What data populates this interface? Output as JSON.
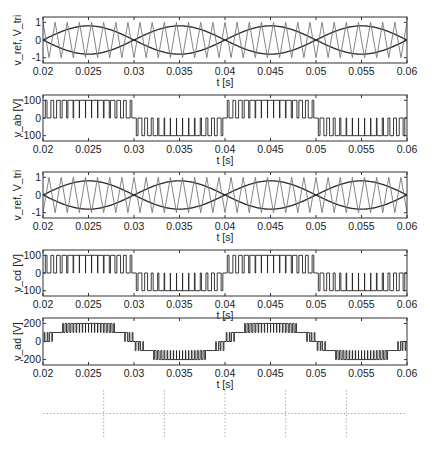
{
  "colors": {
    "axis": "#333333",
    "ref": "#2a2a2a",
    "tri": "#777777",
    "signal": "#222222",
    "grid": "#888888",
    "bar": "#111111"
  },
  "chart_data": [
    {
      "id": "p1",
      "type": "line",
      "ylabel": "v_ref, V_tri",
      "xlabel": "t [s]",
      "box": [
        43,
        17,
        364,
        46
      ],
      "xlim": [
        0.02,
        0.06
      ],
      "ylim": [
        -1.3,
        1.3
      ],
      "xticks": [
        0.02,
        0.025,
        0.03,
        0.035,
        0.04,
        0.045,
        0.05,
        0.055,
        0.06
      ],
      "xticklabels": [
        "0.02",
        "0.025",
        "0.03",
        "0.035",
        "0.04",
        "0.045",
        "0.05",
        "0.055",
        "0.06"
      ],
      "yticks": [
        -1,
        0,
        1
      ],
      "yticklabels": [
        "-1",
        "0",
        "1"
      ],
      "series": [
        {
          "name": "v_ref (+)",
          "kind": "sine",
          "amp": 0.8,
          "freq": 50,
          "phase": 0
        },
        {
          "name": "v_ref (-)",
          "kind": "sine",
          "amp": -0.8,
          "freq": 50,
          "phase": 0
        },
        {
          "name": "V_tri",
          "kind": "triangle",
          "amp": 1.0,
          "freq": 750
        }
      ]
    },
    {
      "id": "p2",
      "type": "line",
      "ylabel": "v_ab [V]",
      "xlabel": "t [s]",
      "box": [
        43,
        95,
        364,
        46
      ],
      "xlim": [
        0.02,
        0.06
      ],
      "ylim": [
        -130,
        130
      ],
      "xticks": [
        0.02,
        0.025,
        0.03,
        0.035,
        0.04,
        0.045,
        0.05,
        0.055,
        0.06
      ],
      "xticklabels": [
        "0.02",
        "0.025",
        "0.03",
        "0.035",
        "0.04",
        "0.045",
        "0.05",
        "0.055",
        "0.06"
      ],
      "yticks": [
        -100,
        0,
        100
      ],
      "yticklabels": [
        "-100",
        "0",
        "100"
      ],
      "series": [
        {
          "name": "v_ab",
          "kind": "unipolar_pwm",
          "vdc": 100,
          "amp": 0.8,
          "freq": 50,
          "carrier": 750,
          "phase": 0
        }
      ]
    },
    {
      "id": "p3",
      "type": "line",
      "ylabel": "v_ref, V_tri",
      "xlabel": "t [s]",
      "box": [
        43,
        172,
        364,
        46
      ],
      "xlim": [
        0.02,
        0.06
      ],
      "ylim": [
        -1.3,
        1.3
      ],
      "xticks": [
        0.02,
        0.025,
        0.03,
        0.035,
        0.04,
        0.045,
        0.05,
        0.055,
        0.06
      ],
      "xticklabels": [
        "0.02",
        "0.025",
        "0.03",
        "0.035",
        "0.04",
        "0.045",
        "0.05",
        "0.055",
        "0.06"
      ],
      "yticks": [
        -1,
        0,
        1
      ],
      "yticklabels": [
        "-1",
        "0",
        "1"
      ],
      "series": [
        {
          "name": "v_ref (+)",
          "kind": "sine",
          "amp": 0.8,
          "freq": 50,
          "phase": 0
        },
        {
          "name": "v_ref (-)",
          "kind": "sine",
          "amp": -0.8,
          "freq": 50,
          "phase": 0
        },
        {
          "name": "V_tri",
          "kind": "triangle",
          "amp": 1.0,
          "freq": 750,
          "shift": 0.5
        }
      ]
    },
    {
      "id": "p4",
      "type": "line",
      "ylabel": "v_cd [V]",
      "xlabel": "t [s]",
      "box": [
        43,
        250,
        364,
        46
      ],
      "xlim": [
        0.02,
        0.06
      ],
      "ylim": [
        -130,
        130
      ],
      "xticks": [
        0.02,
        0.025,
        0.03,
        0.035,
        0.04,
        0.045,
        0.05,
        0.055,
        0.06
      ],
      "xticklabels": [
        "0.02",
        "0.025",
        "0.03",
        "0.035",
        "0.04",
        "0.045",
        "0.05",
        "0.055",
        "0.06"
      ],
      "yticks": [
        -100,
        0,
        100
      ],
      "yticklabels": [
        "-100",
        "0",
        "100"
      ],
      "series": [
        {
          "name": "v_cd",
          "kind": "unipolar_pwm",
          "vdc": 100,
          "amp": 0.8,
          "freq": 50,
          "carrier": 750,
          "phase": 0,
          "shift": 0.5
        }
      ]
    },
    {
      "id": "p5",
      "type": "line",
      "ylabel": "v_ad [V]",
      "xlabel": "t [s]",
      "box": [
        43,
        318,
        364,
        47
      ],
      "xlim": [
        0.02,
        0.06
      ],
      "ylim": [
        -260,
        260
      ],
      "xticks": [
        0.02,
        0.025,
        0.03,
        0.035,
        0.04,
        0.045,
        0.05,
        0.055,
        0.06
      ],
      "xticklabels": [
        "0.02",
        "0.025",
        "0.03",
        "0.035",
        "0.04",
        "0.045",
        "0.05",
        "0.055",
        "0.06"
      ],
      "yticks": [
        -200,
        0,
        200
      ],
      "yticklabels": [
        "-200",
        "0",
        "200"
      ],
      "series": [
        {
          "name": "v_ad",
          "kind": "five_level",
          "levels": [
            -200,
            -100,
            0,
            100,
            200
          ]
        }
      ]
    },
    {
      "id": "p6",
      "type": "bar",
      "ylabel": "A [pu]",
      "xlabel": "h",
      "box": [
        43,
        390,
        364,
        47
      ],
      "xlim": [
        0,
        60
      ],
      "ylim": [
        0,
        1
      ],
      "xticks": [
        0,
        10,
        20,
        30,
        40,
        50,
        60
      ],
      "xticklabels": [
        "0",
        "10",
        "20",
        "30",
        "40",
        "50",
        "60"
      ],
      "yticks": [
        0,
        0.5,
        1
      ],
      "yticklabels": [
        "0",
        "0.5",
        "1"
      ],
      "grid": true,
      "categories": [
        2,
        6,
        10,
        14,
        18,
        22,
        26,
        30,
        34,
        38,
        42,
        46,
        50,
        54,
        58
      ],
      "values": [
        0.8,
        0.01,
        0.01,
        0.01,
        0.01,
        0.01,
        0.01,
        0.01,
        0.01,
        0.01,
        0.01,
        0.01,
        0.01,
        0.01,
        0.01
      ]
    }
  ]
}
